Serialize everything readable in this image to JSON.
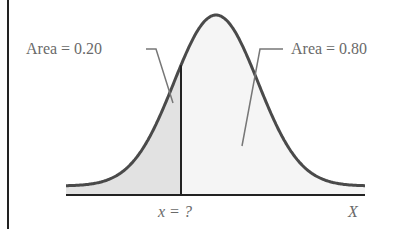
{
  "chart_data": {
    "type": "area",
    "title": "",
    "annotations": [
      {
        "text": "Area = 0.20",
        "region": "left of x"
      },
      {
        "text": "Area = 0.80",
        "region": "right of x"
      }
    ],
    "xlabel": "X",
    "cutoff_label": "x = ?",
    "left_area": 0.2,
    "right_area": 0.8,
    "grid": false,
    "colors": {
      "curve": "#4a4a4a",
      "shade_left": "#e2e2e2",
      "shade_right": "#f6f6f6",
      "axis": "#222222"
    }
  },
  "labels": {
    "left_area": "Area = 0.20",
    "right_area": "Area = 0.80",
    "cutoff": "x = ?",
    "axis": "X"
  }
}
